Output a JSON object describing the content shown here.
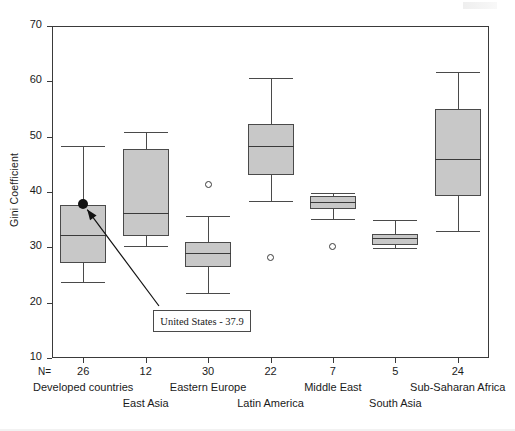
{
  "chart_data": {
    "type": "box",
    "title": "",
    "xlabel": "",
    "ylabel": "Gini Coefficient",
    "ylim": [
      10,
      70
    ],
    "yticks": [
      70,
      60,
      50,
      40,
      30,
      20,
      10
    ],
    "grid": false,
    "legend": null,
    "n_label": "N=",
    "categories": [
      "Developed countries",
      "East Asia",
      "Eastern Europe",
      "Latin America",
      "Middle East",
      "South Asia",
      "Sub-Saharan Africa"
    ],
    "n_values": [
      26,
      12,
      30,
      22,
      7,
      5,
      24
    ],
    "boxes": [
      {
        "category": "Developed countries",
        "whisker_low": 23.7,
        "q1": 27.2,
        "median": 32.3,
        "q3": 37.6,
        "whisker_high": 48.3,
        "outliers": []
      },
      {
        "category": "East Asia",
        "whisker_low": 30.3,
        "q1": 32.0,
        "median": 36.2,
        "q3": 47.8,
        "whisker_high": 50.9,
        "outliers": []
      },
      {
        "category": "Eastern Europe",
        "whisker_low": 21.8,
        "q1": 26.5,
        "median": 28.9,
        "q3": 31.0,
        "whisker_high": 35.7,
        "outliers": [
          41.3
        ]
      },
      {
        "category": "Latin America",
        "whisker_low": 38.4,
        "q1": 43.1,
        "median": 48.3,
        "q3": 52.3,
        "whisker_high": 60.6,
        "outliers": [
          28.2
        ]
      },
      {
        "category": "Middle East",
        "whisker_low": 35.2,
        "q1": 36.9,
        "median": 38.2,
        "q3": 39.2,
        "whisker_high": 39.8,
        "outliers": [
          30.1
        ]
      },
      {
        "category": "South Asia",
        "whisker_low": 29.9,
        "q1": 30.5,
        "median": 31.7,
        "q3": 32.4,
        "whisker_high": 35.0,
        "outliers": []
      },
      {
        "category": "Sub-Saharan Africa",
        "whisker_low": 33.0,
        "q1": 39.2,
        "median": 45.9,
        "q3": 55.0,
        "whisker_high": 61.6,
        "outliers": []
      }
    ],
    "annotation": {
      "label": "United States - 37.9",
      "marker_category": "Developed countries",
      "marker_value": 37.9
    },
    "colors": {
      "box_fill": "#c8c8c8",
      "box_stroke": "#4a4a4a",
      "median": "#3a3a3a",
      "marker": "#111111",
      "axis": "#3a3a3a"
    }
  },
  "ytick_labels": [
    "70",
    "60",
    "50",
    "40",
    "30",
    "20",
    "10"
  ]
}
